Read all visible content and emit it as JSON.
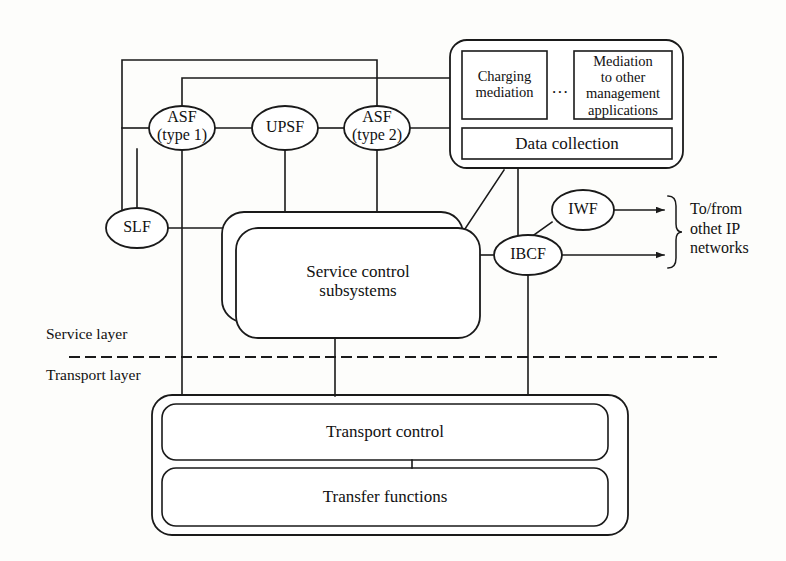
{
  "diagram": {
    "stroke_color": "#1a1a1a",
    "background_color": "#fdfdfb",
    "fill_color": "#ffffff"
  },
  "nodes": {
    "asf_type1": "ASF\n(type 1)",
    "asf_type1_line1": "ASF",
    "asf_type1_line2": "(type 1)",
    "upsf": "UPSF",
    "asf_type2_line1": "ASF",
    "asf_type2_line2": "(type 2)",
    "slf": "SLF",
    "iwf": "IWF",
    "ibcf": "IBCF"
  },
  "management": {
    "charging_mediation_line1": "Charging",
    "charging_mediation_line2": "mediation",
    "ellipsis": "...",
    "other_mediation_line1": "Mediation",
    "other_mediation_line2": "to other",
    "other_mediation_line3": "management",
    "other_mediation_line4": "applications",
    "data_collection": "Data collection"
  },
  "service": {
    "subsystems_line1": "Service control",
    "subsystems_line2": "subsystems"
  },
  "transport": {
    "control": "Transport control",
    "functions": "Transfer functions"
  },
  "layers": {
    "service_layer": "Service layer",
    "transport_layer": "Transport layer"
  },
  "external": {
    "to_from_line1": "To/from",
    "to_from_line2": "othet IP",
    "to_from_line3": "networks"
  }
}
